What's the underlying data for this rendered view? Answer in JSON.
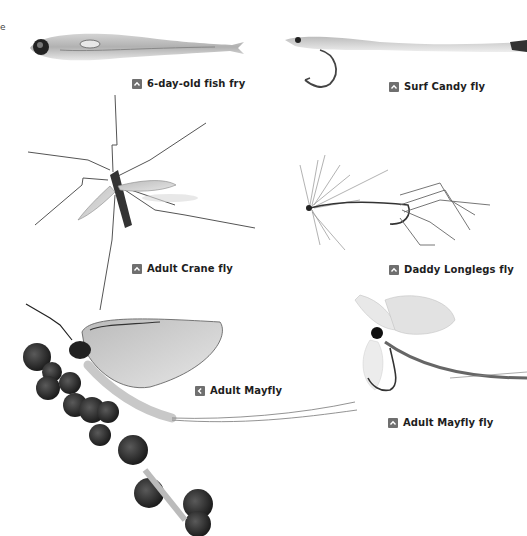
{
  "page": {
    "edge_fragment": "e",
    "background": "#ffffff",
    "caption_icon_color": "#6f6f6f",
    "caption_text_color": "#1e1e1e"
  },
  "figures": [
    {
      "id": "fish-fry",
      "caption": "6-day-old fish fry",
      "icon": "arrow-up-icon"
    },
    {
      "id": "surf-candy",
      "caption": "Surf Candy fly",
      "icon": "arrow-up-icon"
    },
    {
      "id": "crane-fly",
      "caption": "Adult Crane fly",
      "icon": "arrow-up-icon"
    },
    {
      "id": "daddy-longlegs",
      "caption": "Daddy Longlegs fly",
      "icon": "arrow-up-icon"
    },
    {
      "id": "mayfly",
      "caption": "Adult Mayfly",
      "icon": "arrow-left-icon"
    },
    {
      "id": "mayfly-fly",
      "caption": "Adult Mayfly fly",
      "icon": "arrow-up-icon"
    }
  ]
}
